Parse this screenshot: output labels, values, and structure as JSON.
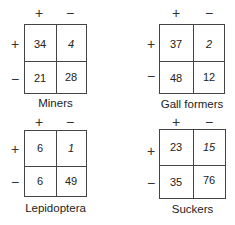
{
  "header_signs": {
    "plus": "+",
    "minus": "−"
  },
  "tables": [
    {
      "label": "Miners",
      "cells": [
        [
          "34",
          "4"
        ],
        [
          "21",
          "28"
        ]
      ],
      "italic": [
        [
          false,
          true
        ],
        [
          false,
          false
        ]
      ]
    },
    {
      "label": "Gall formers",
      "cells": [
        [
          "37",
          "2"
        ],
        [
          "48",
          "12"
        ]
      ],
      "italic": [
        [
          false,
          true
        ],
        [
          false,
          false
        ]
      ]
    },
    {
      "label": "Lepidoptera",
      "cells": [
        [
          "6",
          "1"
        ],
        [
          "6",
          "49"
        ]
      ],
      "italic": [
        [
          false,
          true
        ],
        [
          false,
          false
        ]
      ]
    },
    {
      "label": "Suckers",
      "cells": [
        [
          "23",
          "15"
        ],
        [
          "35",
          "76"
        ]
      ],
      "italic": [
        [
          false,
          true
        ],
        [
          false,
          false
        ]
      ]
    }
  ]
}
